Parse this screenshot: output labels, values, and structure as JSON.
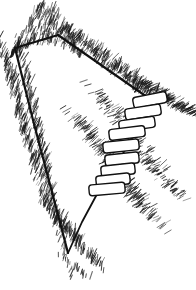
{
  "figure": {
    "description": "Pen-and-ink line drawing of a V-shaped gully or ravine seen in perspective, with a flight of stone steps descending the right-hand bank, surrounded by fine hatched grass texture.",
    "medium": "pen-and-ink line drawing",
    "ink_color": "#1a1a1a",
    "paper_color": "#ffffff",
    "canvas": {
      "width": 196,
      "height": 290
    }
  },
  "chart_data": {
    "type": "line",
    "xlabel": "",
    "ylabel": "",
    "xlim": [
      0,
      196
    ],
    "ylim": [
      0,
      290
    ],
    "grid": false,
    "legend": "none",
    "series": [
      {
        "name": "ravine-outline",
        "kind": "polyline",
        "closed": false,
        "stroke": "#111111",
        "stroke_width": 2.0,
        "points": [
          [
            15,
            48
          ],
          [
            58,
            35
          ],
          [
            147,
            97
          ],
          [
            120,
            120
          ],
          [
            96,
            146
          ],
          [
            79,
            172
          ],
          [
            68,
            253
          ],
          [
            40,
            150
          ],
          [
            22,
            92
          ],
          [
            15,
            48
          ]
        ]
      },
      {
        "name": "left-ridge-edge",
        "kind": "polyline",
        "closed": false,
        "stroke": "#111111",
        "stroke_width": 2.2,
        "points": [
          [
            15,
            48
          ],
          [
            58,
            35
          ]
        ]
      },
      {
        "name": "right-ridge-edge",
        "kind": "polyline",
        "closed": false,
        "stroke": "#111111",
        "stroke_width": 2.2,
        "points": [
          [
            58,
            35
          ],
          [
            147,
            97
          ]
        ]
      },
      {
        "name": "left-gully-wall",
        "kind": "polyline",
        "closed": false,
        "stroke": "#111111",
        "stroke_width": 2.2,
        "points": [
          [
            15,
            48
          ],
          [
            33,
            120
          ],
          [
            52,
            192
          ],
          [
            68,
            253
          ]
        ]
      },
      {
        "name": "right-gully-wall",
        "kind": "polyline",
        "closed": false,
        "stroke": "#111111",
        "stroke_width": 1.8,
        "points": [
          [
            68,
            253
          ],
          [
            82,
            222
          ],
          [
            96,
            196
          ],
          [
            112,
            172
          ],
          [
            128,
            145
          ],
          [
            140,
            120
          ],
          [
            147,
            97
          ]
        ]
      }
    ],
    "steps": {
      "name": "stone-steps",
      "count": 9,
      "stroke": "#111111",
      "stroke_width": 1.4,
      "fill": "#ffffff",
      "corner_radius": 3,
      "items": [
        {
          "index": 1,
          "cx": 150,
          "cy": 100,
          "w": 34,
          "h": 11,
          "angle": -11
        },
        {
          "index": 2,
          "cx": 143,
          "cy": 112,
          "w": 36,
          "h": 11,
          "angle": -9
        },
        {
          "index": 3,
          "cx": 137,
          "cy": 124,
          "w": 36,
          "h": 11,
          "angle": -8
        },
        {
          "index": 4,
          "cx": 127,
          "cy": 133,
          "w": 36,
          "h": 11,
          "angle": -7
        },
        {
          "index": 5,
          "cx": 121,
          "cy": 146,
          "w": 36,
          "h": 11,
          "angle": -6
        },
        {
          "index": 6,
          "cx": 122,
          "cy": 159,
          "w": 34,
          "h": 11,
          "angle": -6
        },
        {
          "index": 7,
          "cx": 118,
          "cy": 170,
          "w": 34,
          "h": 11,
          "angle": -6
        },
        {
          "index": 8,
          "cx": 113,
          "cy": 180,
          "w": 34,
          "h": 11,
          "angle": -6
        },
        {
          "index": 9,
          "cx": 107,
          "cy": 189,
          "w": 36,
          "h": 11,
          "angle": -5
        }
      ]
    },
    "texture": {
      "name": "grass-hatching",
      "style": "short-stroke-stipple",
      "stroke": "#1a1a1a",
      "stroke_width": 0.7,
      "seed": 20240517,
      "bands": [
        {
          "id": "upper-left-ridge",
          "kind": "mound",
          "x0": 10,
          "y0": 6,
          "x1": 80,
          "y1": 58,
          "density": 260,
          "len": 7,
          "angle": -72,
          "jitter": 26
        },
        {
          "id": "top-right-ridge",
          "kind": "band",
          "x0": 58,
          "y0": 26,
          "x1": 160,
          "y1": 104,
          "density": 300,
          "len": 7,
          "angle": -60,
          "jitter": 30
        },
        {
          "id": "right-shoulder",
          "kind": "band",
          "x0": 132,
          "y0": 78,
          "x1": 196,
          "y1": 118,
          "density": 150,
          "len": 7,
          "angle": -26,
          "jitter": 28
        },
        {
          "id": "left-outer-slope",
          "kind": "band",
          "x0": 2,
          "y0": 48,
          "x1": 44,
          "y1": 206,
          "density": 210,
          "len": 8,
          "angle": -70,
          "jitter": 26
        },
        {
          "id": "left-inner-edge",
          "kind": "band",
          "x0": 20,
          "y0": 52,
          "x1": 60,
          "y1": 250,
          "density": 200,
          "len": 8,
          "angle": -68,
          "jitter": 24
        },
        {
          "id": "gully-floor",
          "kind": "band",
          "x0": 46,
          "y0": 206,
          "x1": 96,
          "y1": 268,
          "density": 130,
          "len": 8,
          "angle": -74,
          "jitter": 28
        },
        {
          "id": "right-inner-slope",
          "kind": "band",
          "x0": 74,
          "y0": 118,
          "x1": 150,
          "y1": 222,
          "density": 230,
          "len": 8,
          "angle": -36,
          "jitter": 26
        },
        {
          "id": "step-surround",
          "kind": "band",
          "x0": 96,
          "y0": 92,
          "x1": 178,
          "y1": 200,
          "density": 180,
          "len": 6,
          "angle": -30,
          "jitter": 30
        },
        {
          "id": "below-gully",
          "kind": "band",
          "x0": 62,
          "y0": 258,
          "x1": 92,
          "y1": 284,
          "density": 22,
          "len": 6,
          "angle": -80,
          "jitter": 22
        }
      ]
    }
  }
}
